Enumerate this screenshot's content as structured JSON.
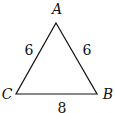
{
  "diagram": {
    "type": "triangle",
    "vertices": [
      {
        "name": "A",
        "x": 56,
        "y": 23,
        "label_x": 57,
        "label_y": 14
      },
      {
        "name": "B",
        "x": 97,
        "y": 94,
        "label_x": 108,
        "label_y": 99
      },
      {
        "name": "C",
        "x": 16,
        "y": 94,
        "label_x": 7,
        "label_y": 99
      }
    ],
    "sides": [
      {
        "between": "A-C",
        "label": "6",
        "label_x": 29,
        "label_y": 55
      },
      {
        "between": "A-B",
        "label": "6",
        "label_x": 87,
        "label_y": 55
      },
      {
        "between": "C-B",
        "label": "8",
        "label_x": 62,
        "label_y": 113
      }
    ],
    "stroke_color": "#111111"
  }
}
